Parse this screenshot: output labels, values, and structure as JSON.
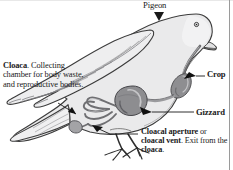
{
  "figure": {
    "background_color": "#ffffff",
    "ink_color": "#1a1a1a"
  },
  "labels": {
    "pigeon": "Pigeon",
    "crop": "Crop",
    "gizzard": "Gizzard",
    "cloaca": {
      "term": "Cloaca",
      "rest": ". Collecting chamber for body waste, and reproductive bodies."
    },
    "cloacal_aperture": {
      "term1": "Cloacal aperture",
      "conj": " or ",
      "term2": "cloacal vent",
      "mid": ". Exit from the ",
      "term3": "cloaca",
      "end": "."
    }
  },
  "colors": {
    "body_fill": "#e9e9ea",
    "body_fill_light": "#f2f2f3",
    "outline": "#3c3c3c",
    "organ_mid": "#9a9a9c",
    "organ_dark": "#6f6f72",
    "organ_light": "#c3c3c5",
    "feather_line": "#8d8d90",
    "frame": "#9a9a9a"
  }
}
